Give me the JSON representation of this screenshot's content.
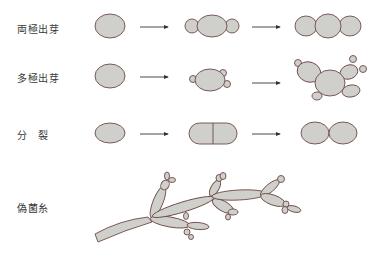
{
  "diagram": {
    "rows": [
      {
        "id": "bipolar-budding",
        "label": "両極出芽"
      },
      {
        "id": "multipolar-budding",
        "label": "多極出芽"
      },
      {
        "id": "fission",
        "label": "分　裂"
      },
      {
        "id": "pseudohyphae",
        "label": "偽菌糸"
      }
    ],
    "colors": {
      "cell_fill": "#cfcfcb",
      "cell_outline": "#6e4a48",
      "arrow": "#333333",
      "background": "#ffffff"
    }
  }
}
